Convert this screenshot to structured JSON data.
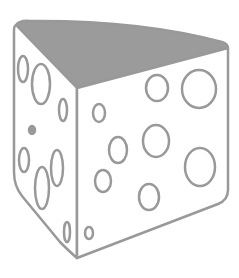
{
  "image": {
    "subject": "cheese wedge illustration",
    "alt": "Line drawing of a wedge of Swiss cheese with holes"
  },
  "colors": {
    "background": "#ffffff",
    "outline": "#999999",
    "top_face": "#9b9b9b",
    "faces": "#ffffff"
  },
  "cheese": {
    "left_face_holes": [
      {
        "cx": 23,
        "cy": 69,
        "rx": 5,
        "ry": 13
      },
      {
        "cx": 41,
        "cy": 84,
        "rx": 9,
        "ry": 20
      },
      {
        "cx": 63,
        "cy": 110,
        "rx": 4,
        "ry": 11
      },
      {
        "cx": 32,
        "cy": 130,
        "rx": 3,
        "ry": 4,
        "filled": true
      },
      {
        "cx": 24,
        "cy": 160,
        "rx": 5,
        "ry": 12
      },
      {
        "cx": 42,
        "cy": 188,
        "rx": 7,
        "ry": 21
      },
      {
        "cx": 57,
        "cy": 168,
        "rx": 6,
        "ry": 18
      },
      {
        "cx": 67,
        "cy": 232,
        "rx": 3,
        "ry": 10
      }
    ],
    "right_face_holes": [
      {
        "cx": 157,
        "cy": 88,
        "rx": 11,
        "ry": 13
      },
      {
        "cx": 199,
        "cy": 89,
        "rx": 17,
        "ry": 19
      },
      {
        "cx": 99,
        "cy": 113,
        "rx": 6,
        "ry": 9
      },
      {
        "cx": 118,
        "cy": 150,
        "rx": 9,
        "ry": 13
      },
      {
        "cx": 156,
        "cy": 141,
        "rx": 13,
        "ry": 16
      },
      {
        "cx": 200,
        "cy": 167,
        "rx": 15,
        "ry": 19
      },
      {
        "cx": 103,
        "cy": 181,
        "rx": 8,
        "ry": 11
      },
      {
        "cx": 149,
        "cy": 197,
        "rx": 10,
        "ry": 13
      },
      {
        "cx": 89,
        "cy": 233,
        "rx": 4,
        "ry": 6
      }
    ]
  }
}
